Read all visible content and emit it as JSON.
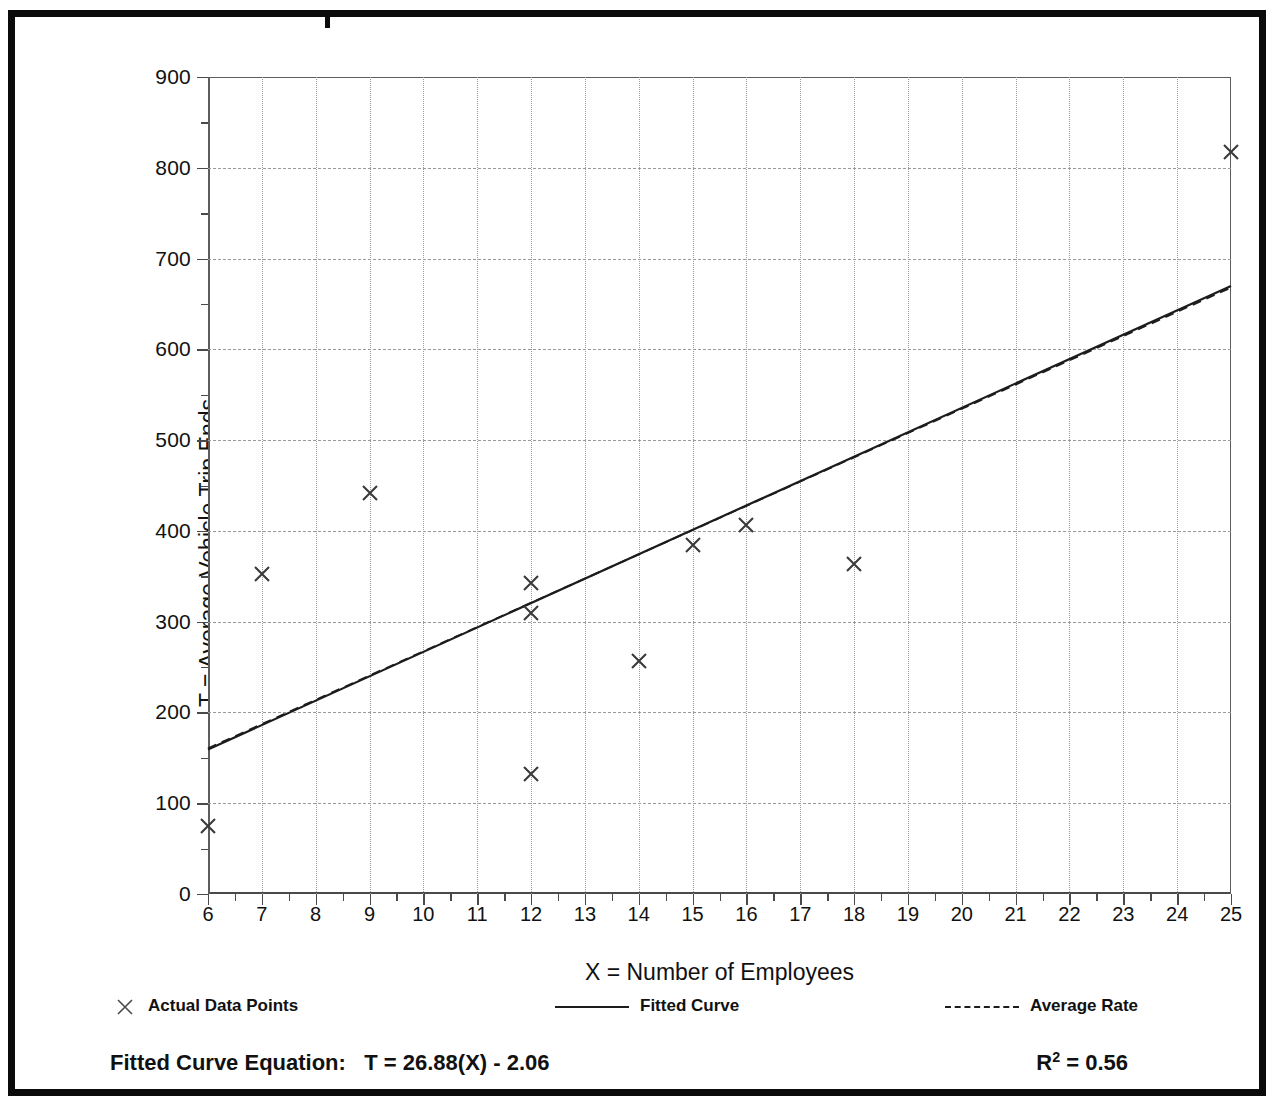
{
  "chart_data": {
    "type": "scatter",
    "title": "",
    "xlabel": "X = Number of Employees",
    "ylabel": "T = Average Vehicle Trip Ends",
    "xlim": [
      6,
      25
    ],
    "ylim": [
      0,
      900
    ],
    "xticks": [
      6,
      7,
      8,
      9,
      10,
      11,
      12,
      13,
      14,
      15,
      16,
      17,
      18,
      19,
      20,
      21,
      22,
      23,
      24,
      25
    ],
    "yticks": [
      0,
      100,
      200,
      300,
      400,
      500,
      600,
      700,
      800,
      900
    ],
    "y_minor_step": 50,
    "grid": true,
    "legend_position": "below-axis",
    "series": [
      {
        "name": "Actual Data Points",
        "type": "scatter",
        "marker": "x",
        "points": [
          {
            "x": 6,
            "y": 75
          },
          {
            "x": 7,
            "y": 352
          },
          {
            "x": 9,
            "y": 442
          },
          {
            "x": 12,
            "y": 343
          },
          {
            "x": 12,
            "y": 310
          },
          {
            "x": 12,
            "y": 132
          },
          {
            "x": 14,
            "y": 257
          },
          {
            "x": 15,
            "y": 385
          },
          {
            "x": 16,
            "y": 406
          },
          {
            "x": 18,
            "y": 363
          },
          {
            "x": 25,
            "y": 817
          }
        ]
      },
      {
        "name": "Fitted Curve",
        "type": "line",
        "style": "solid",
        "equation": "T = 26.88(X) - 2.06",
        "slope": 26.88,
        "intercept": -2.06,
        "endpoints": [
          {
            "x": 6,
            "y": 159.2
          },
          {
            "x": 25,
            "y": 669.9
          }
        ]
      },
      {
        "name": "Average Rate",
        "type": "line",
        "style": "dashed",
        "endpoints": [
          {
            "x": 6,
            "y": 160.5
          },
          {
            "x": 25,
            "y": 668.0
          }
        ]
      }
    ]
  },
  "axes": {
    "y_title": "T = Average Vehicle Trip Ends",
    "x_title": "X = Number of Employees"
  },
  "legend": {
    "items": [
      {
        "label": "Actual Data Points",
        "symbol": "x-marker"
      },
      {
        "label": "Fitted Curve",
        "symbol": "solid-line"
      },
      {
        "label": "Average Rate",
        "symbol": "dashed-line"
      }
    ]
  },
  "footer": {
    "equation_label": "Fitted Curve Equation:",
    "equation_value": "T = 26.88(X) - 2.06",
    "r_squared_symbol": "R",
    "r_squared_exponent": "2",
    "r_squared_value": "= 0.56"
  },
  "colors": {
    "frame": "#0b0b0b",
    "grid": "#9a9a9a",
    "axis": "#4a4a4a",
    "marker": "#3a3a3a",
    "fit_line": "#1c1c1c"
  }
}
